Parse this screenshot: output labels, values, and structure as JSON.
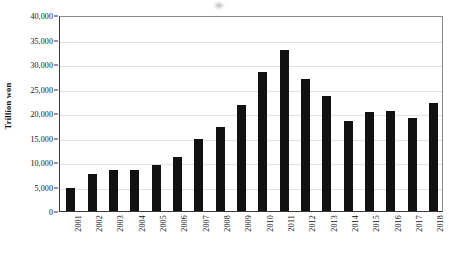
{
  "figure": {
    "background_color": "#ffffff",
    "bar_color": "#111111",
    "gridline_color": "#e2e2e2",
    "axis_color": "#333333",
    "artifact_name": "scan-speck"
  },
  "chart_data": {
    "type": "bar",
    "title": "",
    "subtitle": "",
    "xlabel": "",
    "ylabel": "Trillion won",
    "ylim": [
      0,
      40000
    ],
    "grid": true,
    "legend": null,
    "legend_position": "none",
    "categories": [
      "2001",
      "2002",
      "2003",
      "2004",
      "2005",
      "2006",
      "2007",
      "2008",
      "2009",
      "2010",
      "2011",
      "2012",
      "2013",
      "2014",
      "2015",
      "2016",
      "2017",
      "2018"
    ],
    "values": [
      4700,
      7500,
      8400,
      8300,
      9300,
      11000,
      14700,
      17200,
      21600,
      28300,
      32800,
      27000,
      23500,
      18300,
      20300,
      20400,
      19000,
      22000
    ],
    "ytick_labels": [
      "0",
      "5,000",
      "10,000",
      "15,000",
      "20,000",
      "25,000",
      "30,000",
      "35,000",
      "40,000"
    ],
    "ytick_values": [
      0,
      5000,
      10000,
      15000,
      20000,
      25000,
      30000,
      35000,
      40000
    ]
  }
}
